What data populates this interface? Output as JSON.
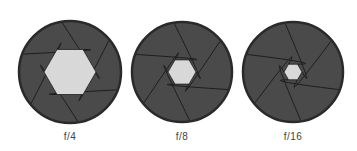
{
  "diagram": {
    "colors": {
      "background": "#ffffff",
      "blade": "#4a4a4a",
      "rim": "#2a2a2a",
      "blade_line": "#1e1e1e",
      "opening": "#d8d8d8"
    },
    "apertures": [
      {
        "label": "f/4",
        "cx": 70,
        "cy": 72,
        "r": 51,
        "opening_radius": 26
      },
      {
        "label": "f/8",
        "cx": 182,
        "cy": 72,
        "r": 50,
        "opening_radius": 14
      },
      {
        "label": "f/16",
        "cx": 293,
        "cy": 72,
        "r": 50,
        "opening_radius": 9
      }
    ]
  }
}
